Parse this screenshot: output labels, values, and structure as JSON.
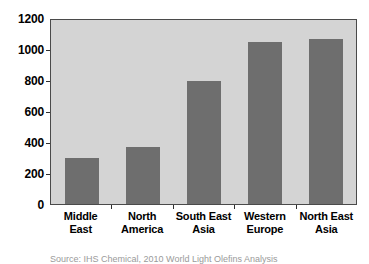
{
  "chart_data": {
    "type": "bar",
    "title": "",
    "xlabel": "",
    "ylabel": "",
    "categories": [
      "Middle East",
      "North America",
      "South East Asia",
      "Western Europe",
      "North East Asia"
    ],
    "category_lines": [
      [
        "Middle East"
      ],
      [
        "North",
        "America"
      ],
      [
        "South East",
        "Asia"
      ],
      [
        "Western",
        "Europe"
      ],
      [
        "North East",
        "Asia"
      ]
    ],
    "values": [
      300,
      370,
      795,
      1045,
      1065
    ],
    "ylim": [
      0,
      1200
    ],
    "yticks": [
      0,
      200,
      400,
      600,
      800,
      1000,
      1200
    ],
    "ytick_labels": [
      "0",
      "200",
      "400",
      "600",
      "800",
      "1000",
      "1200"
    ],
    "grid": false,
    "legend": "none",
    "bar_color": "#6e6e6e",
    "plot_background": "#d4d4d4",
    "axis_color": "#4a4a4a"
  },
  "source_note": "Source: IHS Chemical, 2010 World Light Olefins Analysis"
}
